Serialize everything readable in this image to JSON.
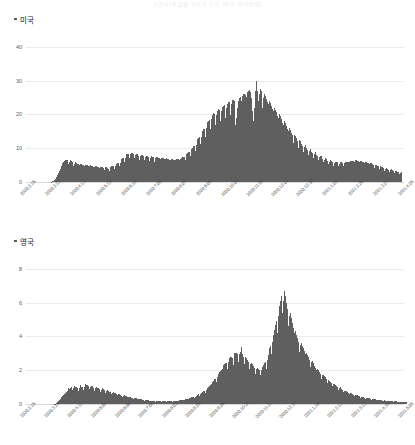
{
  "page": {
    "title": "코로나19 일별 확진자 추이 (인구 10만명당)"
  },
  "charts": [
    {
      "id": "chart-usa",
      "legend_label": "미국",
      "y_ticks": [
        "40",
        "30",
        "20",
        "10",
        "0"
      ],
      "x_ticks": [
        "2020.2.15",
        "2020.3.15",
        "2020.4.13",
        "2020.5.12",
        "2020.6.10",
        "2020.7.09",
        "2020.8.07",
        "2020.9.05",
        "2020.10.06",
        "2020.11.02",
        "2020.12.01",
        "2020.12.30",
        "2021.1.28",
        "2021.2.26",
        "2021.3.27",
        "2021.4.25"
      ]
    },
    {
      "id": "chart-uk",
      "legend_label": "영국",
      "y_ticks": [
        "8",
        "6",
        "4",
        "2",
        "0"
      ],
      "x_ticks": [
        "2020.2.15",
        "2020.3.14",
        "2020.4.11",
        "2020.5.09",
        "2020.6.06",
        "2020.7.04",
        "2020.8.01",
        "2020.8.29",
        "2020.9.26",
        "2020.10.24",
        "2020.11.21",
        "2020.12.19",
        "2021.1.16",
        "2021.2.13",
        "2021.3.13",
        "2021.4.10",
        "2021.5.08"
      ]
    }
  ],
  "colors": {
    "bar": "#5f5f5f",
    "grid": "#ebebed",
    "text": "#222222"
  },
  "chart_data": [
    {
      "type": "bar",
      "title": "미국",
      "xlabel": "",
      "ylabel": "",
      "ylim": [
        0,
        45
      ],
      "grid": true,
      "legend": [
        "미국"
      ],
      "legend_position": "top-left",
      "x": [
        "2020.2.15",
        "2020.3.15",
        "2020.4.13",
        "2020.5.12",
        "2020.6.10",
        "2020.7.09",
        "2020.8.07",
        "2020.9.05",
        "2020.10.06",
        "2020.11.02",
        "2020.12.01",
        "2020.12.30",
        "2021.1.28",
        "2021.2.26",
        "2021.3.27",
        "2021.4.25"
      ],
      "values": [
        0,
        0,
        0,
        0,
        0,
        0,
        0,
        0,
        0,
        0,
        0,
        0,
        0,
        0,
        0,
        0,
        0,
        0,
        0,
        0,
        0,
        0,
        0,
        0,
        0,
        0,
        0,
        0,
        0,
        0,
        0.1,
        0.2,
        0.3,
        0.5,
        0.8,
        1.2,
        1.6,
        2.2,
        2.8,
        3.4,
        4.0,
        4.6,
        5.2,
        5.6,
        5.9,
        6.2,
        6.5,
        6.4,
        6.6,
        6.3,
        5.2,
        6.0,
        6.4,
        6.2,
        6.0,
        5.5,
        4.6,
        5.4,
        5.8,
        5.6,
        5.4,
        5.2,
        4.4,
        5.0,
        5.4,
        5.3,
        5.1,
        4.9,
        4.2,
        4.8,
        5.1,
        5.0,
        4.9,
        4.7,
        4.0,
        4.6,
        4.9,
        4.8,
        4.7,
        4.5,
        3.8,
        4.4,
        4.7,
        4.6,
        4.5,
        4.3,
        3.6,
        4.2,
        4.5,
        4.4,
        4.3,
        4.1,
        3.5,
        4.0,
        4.4,
        4.3,
        4.2,
        4.0,
        3.4,
        4.0,
        4.5,
        4.6,
        4.7,
        4.6,
        3.9,
        4.6,
        5.2,
        5.4,
        5.6,
        5.6,
        4.8,
        5.6,
        6.4,
        6.8,
        7.0,
        7.0,
        6.0,
        7.0,
        7.8,
        8.2,
        8.4,
        8.4,
        7.2,
        8.2,
        8.6,
        8.6,
        8.4,
        8.2,
        7.0,
        8.0,
        8.3,
        8.2,
        8.0,
        7.8,
        6.6,
        7.6,
        8.0,
        7.9,
        7.8,
        7.6,
        6.4,
        7.4,
        7.8,
        7.7,
        7.5,
        7.3,
        6.2,
        7.2,
        7.6,
        7.5,
        7.3,
        7.1,
        6.0,
        7.0,
        7.4,
        7.3,
        7.2,
        7.0,
        5.9,
        6.9,
        7.2,
        7.1,
        7.0,
        6.8,
        5.8,
        6.8,
        7.0,
        6.9,
        6.8,
        6.6,
        5.6,
        6.6,
        6.8,
        6.7,
        6.6,
        6.4,
        5.5,
        6.5,
        6.8,
        6.8,
        6.7,
        6.6,
        5.6,
        6.8,
        7.2,
        7.4,
        7.5,
        7.5,
        6.4,
        7.6,
        8.2,
        8.6,
        8.8,
        8.8,
        7.6,
        9.0,
        9.8,
        10.2,
        10.6,
        10.8,
        9.2,
        11.0,
        12.0,
        12.6,
        13.0,
        13.2,
        11.2,
        13.4,
        14.6,
        15.2,
        15.6,
        15.8,
        13.4,
        16.0,
        17.2,
        17.8,
        18.2,
        18.4,
        15.6,
        18.6,
        19.8,
        20.2,
        20.4,
        20.2,
        17.0,
        19.8,
        21.0,
        21.4,
        21.6,
        21.4,
        18.0,
        21.0,
        22.2,
        22.6,
        22.8,
        22.4,
        19.0,
        22.0,
        23.2,
        23.6,
        23.8,
        23.4,
        19.8,
        23.0,
        24.2,
        24.4,
        24.0,
        20.0,
        17.0,
        19.0,
        22.0,
        24.0,
        25.0,
        25.2,
        21.0,
        24.0,
        25.6,
        26.0,
        26.2,
        25.8,
        21.8,
        25.2,
        26.6,
        27.0,
        27.2,
        26.6,
        22.4,
        25.0,
        21.0,
        18.0,
        22.0,
        27.0,
        29.0,
        30.0,
        27.0,
        24.0,
        26.0,
        27.5,
        27.0,
        26.0,
        22.0,
        25.0,
        26.0,
        25.4,
        24.6,
        23.6,
        19.8,
        23.0,
        24.0,
        23.4,
        22.6,
        21.6,
        18.2,
        21.0,
        22.0,
        21.4,
        20.6,
        19.6,
        16.4,
        19.0,
        20.0,
        19.4,
        18.6,
        17.6,
        14.8,
        17.0,
        18.0,
        17.4,
        16.6,
        15.6,
        13.2,
        15.0,
        16.0,
        15.4,
        14.6,
        13.8,
        11.6,
        13.4,
        14.0,
        13.6,
        13.0,
        12.2,
        10.2,
        11.8,
        12.4,
        12.0,
        11.4,
        10.8,
        9.0,
        10.4,
        11.0,
        10.6,
        10.2,
        9.6,
        8.0,
        9.2,
        9.8,
        9.4,
        9.0,
        8.6,
        7.2,
        8.2,
        8.8,
        8.4,
        8.0,
        7.6,
        6.4,
        7.4,
        7.8,
        7.6,
        7.2,
        6.8,
        5.8,
        6.6,
        7.0,
        6.8,
        6.5,
        6.2,
        5.2,
        6.0,
        6.4,
        6.2,
        6.0,
        5.8,
        4.8,
        5.6,
        6.0,
        5.9,
        5.8,
        5.6,
        4.7,
        5.4,
        5.8,
        5.8,
        5.7,
        5.6,
        4.7,
        5.5,
        5.9,
        6.0,
        6.0,
        5.9,
        5.0,
        5.8,
        6.2,
        6.3,
        6.3,
        6.2,
        5.2,
        6.0,
        6.4,
        6.4,
        6.3,
        6.2,
        5.2,
        6.0,
        6.3,
        6.2,
        6.0,
        5.8,
        4.9,
        5.6,
        6.0,
        5.9,
        5.7,
        5.5,
        4.6,
        5.3,
        5.6,
        5.5,
        5.3,
        5.0,
        4.2,
        4.8,
        5.1,
        5.0,
        4.8,
        4.6,
        3.8,
        4.4,
        4.6,
        4.5,
        4.3,
        4.1,
        3.4,
        3.9,
        4.2,
        4.1,
        3.9,
        3.7,
        3.1,
        3.5,
        3.8,
        3.7,
        3.5,
        3.3,
        2.8,
        3.2,
        3.4,
        3.3,
        3.1,
        2.9,
        2.4,
        2.8,
        3.0
      ]
    },
    {
      "type": "bar",
      "title": "영국",
      "xlabel": "",
      "ylabel": "",
      "ylim": [
        0,
        9
      ],
      "grid": true,
      "legend": [
        "영국"
      ],
      "legend_position": "top-left",
      "x": [
        "2020.2.15",
        "2020.3.14",
        "2020.4.11",
        "2020.5.09",
        "2020.6.06",
        "2020.7.04",
        "2020.8.01",
        "2020.8.29",
        "2020.9.26",
        "2020.10.24",
        "2020.11.21",
        "2020.12.19",
        "2021.1.16",
        "2021.2.13",
        "2021.3.13",
        "2021.4.10",
        "2021.5.08"
      ],
      "values": [
        0,
        0,
        0,
        0,
        0,
        0,
        0,
        0,
        0,
        0,
        0,
        0,
        0,
        0,
        0,
        0,
        0,
        0,
        0,
        0,
        0,
        0,
        0,
        0,
        0,
        0,
        0,
        0,
        0,
        0,
        0.02,
        0.03,
        0.05,
        0.08,
        0.12,
        0.18,
        0.25,
        0.32,
        0.4,
        0.48,
        0.55,
        0.62,
        0.68,
        0.74,
        0.8,
        0.86,
        0.92,
        0.88,
        0.95,
        1.0,
        0.82,
        0.95,
        1.05,
        1.02,
        1.0,
        0.95,
        0.78,
        0.92,
        1.1,
        1.05,
        1.02,
        1.0,
        0.84,
        1.0,
        1.2,
        1.15,
        1.1,
        1.05,
        0.88,
        1.0,
        1.08,
        1.04,
        1.0,
        0.96,
        0.8,
        0.92,
        1.0,
        0.96,
        0.92,
        0.88,
        0.74,
        0.84,
        0.92,
        0.88,
        0.84,
        0.8,
        0.66,
        0.76,
        0.82,
        0.78,
        0.74,
        0.7,
        0.58,
        0.66,
        0.72,
        0.68,
        0.64,
        0.6,
        0.5,
        0.56,
        0.6,
        0.57,
        0.54,
        0.5,
        0.42,
        0.48,
        0.51,
        0.48,
        0.45,
        0.42,
        0.35,
        0.4,
        0.42,
        0.4,
        0.38,
        0.35,
        0.29,
        0.33,
        0.35,
        0.33,
        0.31,
        0.29,
        0.24,
        0.27,
        0.29,
        0.28,
        0.26,
        0.24,
        0.2,
        0.23,
        0.24,
        0.23,
        0.22,
        0.2,
        0.17,
        0.19,
        0.2,
        0.19,
        0.18,
        0.17,
        0.14,
        0.16,
        0.17,
        0.16,
        0.16,
        0.15,
        0.13,
        0.15,
        0.16,
        0.16,
        0.16,
        0.15,
        0.13,
        0.15,
        0.17,
        0.17,
        0.17,
        0.17,
        0.14,
        0.17,
        0.19,
        0.19,
        0.2,
        0.2,
        0.17,
        0.2,
        0.23,
        0.24,
        0.25,
        0.25,
        0.21,
        0.26,
        0.29,
        0.3,
        0.32,
        0.32,
        0.27,
        0.33,
        0.37,
        0.39,
        0.41,
        0.42,
        0.36,
        0.44,
        0.5,
        0.53,
        0.56,
        0.57,
        0.49,
        0.6,
        0.68,
        0.72,
        0.77,
        0.79,
        0.68,
        0.84,
        0.95,
        1.0,
        1.06,
        1.1,
        0.94,
        1.16,
        1.3,
        1.38,
        1.46,
        1.5,
        1.28,
        1.58,
        1.78,
        1.88,
        1.96,
        2.0,
        1.7,
        2.06,
        2.3,
        2.38,
        2.44,
        2.42,
        2.06,
        2.5,
        2.7,
        2.76,
        2.8,
        2.74,
        2.32,
        2.8,
        3.0,
        3.04,
        3.04,
        2.96,
        2.5,
        2.94,
        3.1,
        3.4,
        2.96,
        2.8,
        2.34,
        2.7,
        2.8,
        2.7,
        2.6,
        2.46,
        2.06,
        2.36,
        2.44,
        2.36,
        2.26,
        2.14,
        1.8,
        2.06,
        2.14,
        2.1,
        2.06,
        2.0,
        1.7,
        2.0,
        2.2,
        2.3,
        2.4,
        2.46,
        2.1,
        2.6,
        2.9,
        3.1,
        3.3,
        3.44,
        2.94,
        3.66,
        4.1,
        4.4,
        4.7,
        4.9,
        4.2,
        5.2,
        5.8,
        6.1,
        6.3,
        6.4,
        5.4,
        6.1,
        6.7,
        6.4,
        6.0,
        5.6,
        4.6,
        5.2,
        5.4,
        5.1,
        4.8,
        4.5,
        3.7,
        4.2,
        4.3,
        4.1,
        3.9,
        3.7,
        3.1,
        3.5,
        3.6,
        3.44,
        3.3,
        3.14,
        2.62,
        2.96,
        3.04,
        2.9,
        2.76,
        2.6,
        2.18,
        2.46,
        2.52,
        2.4,
        2.28,
        2.16,
        1.8,
        2.04,
        2.1,
        2.0,
        1.9,
        1.8,
        1.5,
        1.7,
        1.74,
        1.66,
        1.58,
        1.5,
        1.25,
        1.41,
        1.45,
        1.38,
        1.31,
        1.24,
        1.04,
        1.17,
        1.2,
        1.14,
        1.08,
        1.02,
        0.85,
        0.96,
        0.98,
        0.93,
        0.88,
        0.83,
        0.7,
        0.78,
        0.8,
        0.76,
        0.72,
        0.68,
        0.57,
        0.64,
        0.66,
        0.62,
        0.59,
        0.56,
        0.47,
        0.53,
        0.54,
        0.51,
        0.49,
        0.46,
        0.38,
        0.43,
        0.44,
        0.42,
        0.4,
        0.38,
        0.32,
        0.36,
        0.37,
        0.35,
        0.33,
        0.31,
        0.26,
        0.29,
        0.3,
        0.29,
        0.27,
        0.26,
        0.22,
        0.24,
        0.25,
        0.24,
        0.23,
        0.22,
        0.18,
        0.2,
        0.21,
        0.2,
        0.19,
        0.18,
        0.15,
        0.17,
        0.18,
        0.17,
        0.16,
        0.16,
        0.13,
        0.15,
        0.15,
        0.15,
        0.14,
        0.14,
        0.12,
        0.13,
        0.14,
        0.13,
        0.13,
        0.12,
        0.1,
        0.12,
        0.12
      ]
    }
  ]
}
